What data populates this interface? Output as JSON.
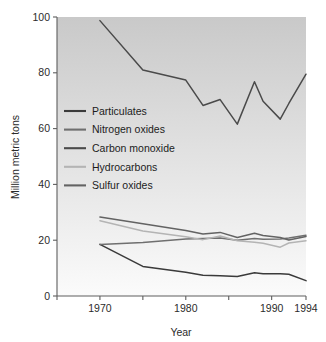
{
  "chart_data": {
    "type": "line",
    "title": "",
    "xlabel": "Year",
    "ylabel": "Million metric tons",
    "xlim": [
      1965,
      1994
    ],
    "ylim": [
      0,
      100
    ],
    "xticks": [
      1965,
      1970,
      1975,
      1980,
      1985,
      1990,
      1994
    ],
    "xtick_labels": [
      "",
      "1970",
      "",
      "1980",
      "",
      "1990",
      "1994"
    ],
    "yticks": [
      0,
      20,
      40,
      60,
      80,
      100
    ],
    "ytick_labels": [
      "0",
      "20",
      "40",
      "60",
      "80",
      "100"
    ],
    "grid": false,
    "legend_position": "upper-left-inside",
    "x": [
      1970,
      1975,
      1980,
      1982,
      1984,
      1986,
      1988,
      1989,
      1991,
      1992,
      1994
    ],
    "series": [
      {
        "name": "Particulates",
        "color": "#3a3a3a",
        "values": [
          18.5,
          10.6,
          8.5,
          7.4,
          7.3,
          7.0,
          8.3,
          8.0,
          8.0,
          7.8,
          5.5
        ]
      },
      {
        "name": "Nitrogen oxides",
        "color": "#6f6f6f",
        "values": [
          18.5,
          19.2,
          20.4,
          20.6,
          20.8,
          20.0,
          20.6,
          20.3,
          20.4,
          20.8,
          21.8
        ]
      },
      {
        "name": "Carbon monoxide",
        "color": "#4a4a4a",
        "values": [
          98.7,
          81.0,
          77.4,
          68.3,
          70.4,
          61.6,
          76.8,
          69.8,
          63.4,
          69.0,
          79.5
        ]
      },
      {
        "name": "Hydrocarbons",
        "color": "#b4b4b4",
        "values": [
          27.0,
          23.3,
          21.2,
          20.2,
          21.5,
          19.8,
          19.3,
          18.9,
          17.5,
          19.0,
          19.8
        ]
      },
      {
        "name": "Sulfur oxides",
        "color": "#636363",
        "values": [
          28.3,
          25.9,
          23.5,
          22.2,
          22.8,
          21.0,
          22.5,
          21.7,
          21.0,
          20.1,
          21.3
        ]
      }
    ],
    "legend_entries": [
      {
        "label": "Particulates",
        "color": "#3a3a3a"
      },
      {
        "label": "Nitrogen oxides",
        "color": "#6f6f6f"
      },
      {
        "label": "Carbon monoxide",
        "color": "#4a4a4a"
      },
      {
        "label": "Hydrocarbons",
        "color": "#b4b4b4"
      },
      {
        "label": "Sulfur oxides",
        "color": "#636363"
      }
    ],
    "background": {
      "top_color": "#c9c9c9",
      "bottom_color": "#fbfbfb"
    }
  }
}
